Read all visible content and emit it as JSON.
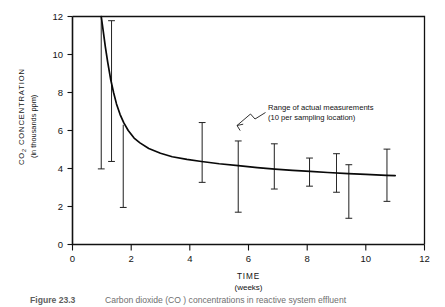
{
  "figure": {
    "caption_label": "Figure 23.3",
    "caption_text": "Carbon dioxide (CO ) concentrations in reactive system effluent"
  },
  "chart_data": {
    "type": "line",
    "title": "",
    "xlabel": "TIME",
    "xlabel_sub": "(weeks)",
    "ylabel": "CO",
    "ylabel_sub_num": "2",
    "ylabel_rest": " CONCENTRATION",
    "ylabel_line2": "(in thousands ppm)",
    "xlim": [
      0,
      12
    ],
    "ylim": [
      0,
      12
    ],
    "xticks": [
      0,
      2,
      4,
      6,
      8,
      10,
      12
    ],
    "yticks": [
      0,
      2,
      4,
      6,
      8,
      10,
      12
    ],
    "xtick_labels": [
      "0",
      "2",
      "4",
      "6",
      "8",
      "10",
      "12"
    ],
    "ytick_labels": [
      "0",
      "2",
      "4",
      "6",
      "8",
      "10",
      "12"
    ],
    "grid": false,
    "legend": "none",
    "series": [
      {
        "name": "CO2 concentration (fitted decay curve)",
        "x": [
          0.98,
          1.05,
          1.12,
          1.2,
          1.3,
          1.4,
          1.5,
          1.62,
          1.75,
          1.9,
          2.1,
          2.3,
          2.6,
          3.0,
          3.4,
          3.9,
          4.4,
          5.0,
          5.65,
          6.3,
          6.9,
          7.5,
          8.1,
          8.7,
          9.4,
          10.0,
          10.7,
          11.0
        ],
        "y": [
          12.0,
          11.2,
          10.4,
          9.6,
          8.7,
          8.0,
          7.4,
          6.85,
          6.4,
          6.0,
          5.6,
          5.35,
          5.05,
          4.8,
          4.62,
          4.48,
          4.37,
          4.25,
          4.15,
          4.05,
          3.97,
          3.9,
          3.85,
          3.79,
          3.73,
          3.69,
          3.64,
          3.62
        ]
      }
    ],
    "error_bars": {
      "description": "Range of actual measurements (10 per sampling location)",
      "points": [
        {
          "x": 0.98,
          "low": 3.98,
          "high": 12.0,
          "cap_top": false,
          "cap_bottom": true
        },
        {
          "x": 1.33,
          "low": 4.37,
          "high": 11.78,
          "cap_top": true,
          "cap_bottom": true
        },
        {
          "x": 1.73,
          "low": 1.95,
          "high": 6.3,
          "cap_top": false,
          "cap_bottom": true
        },
        {
          "x": 4.42,
          "low": 3.27,
          "high": 6.42,
          "cap_top": true,
          "cap_bottom": true
        },
        {
          "x": 5.65,
          "low": 1.7,
          "high": 5.45,
          "cap_top": true,
          "cap_bottom": true
        },
        {
          "x": 6.88,
          "low": 2.92,
          "high": 5.3,
          "cap_top": true,
          "cap_bottom": true
        },
        {
          "x": 8.08,
          "low": 3.07,
          "high": 4.55,
          "cap_top": true,
          "cap_bottom": true
        },
        {
          "x": 9.0,
          "low": 2.75,
          "high": 4.78,
          "cap_top": true,
          "cap_bottom": true
        },
        {
          "x": 9.42,
          "low": 1.38,
          "high": 4.2,
          "cap_top": true,
          "cap_bottom": true
        },
        {
          "x": 10.72,
          "low": 2.27,
          "high": 5.02,
          "cap_top": true,
          "cap_bottom": true
        }
      ]
    },
    "annotations": [
      {
        "line1": "Range of actual measurements",
        "line2": "(10 per sampling location)",
        "target_x": 5.65,
        "target_y": 5.45
      }
    ],
    "colors": {
      "curve": "#090909",
      "errorbar": "#2a2a2a",
      "axis": "#111111",
      "background": "#ffffff"
    }
  }
}
